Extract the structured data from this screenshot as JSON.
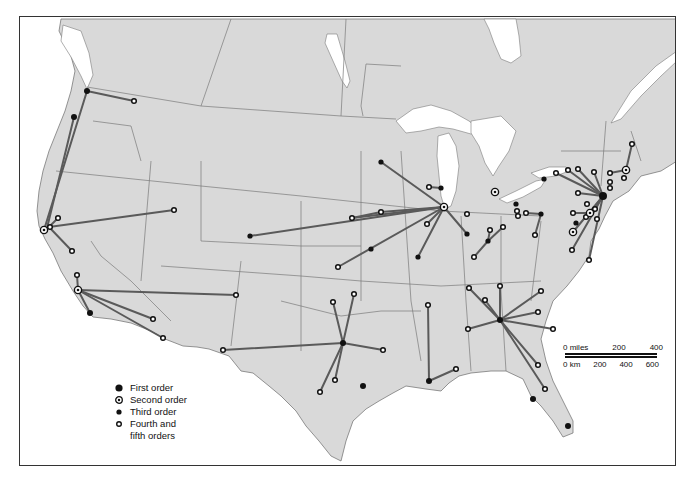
{
  "map": {
    "colors": {
      "land": "#d9d9d9",
      "water": "#ffffff",
      "border": "#7a7a7a",
      "link": "#5a5a5a",
      "frame": "#333333"
    }
  },
  "legend": {
    "items": [
      {
        "symbol": "first-order",
        "label": "First order"
      },
      {
        "symbol": "second-order",
        "label": "Second order"
      },
      {
        "symbol": "third-order",
        "label": "Third order"
      },
      {
        "symbol": "fourth-fifth-order",
        "label": "Fourth and"
      },
      {
        "symbol": "none",
        "label": "fifth orders"
      }
    ]
  },
  "scale_bar": {
    "miles_label": "0 miles",
    "miles_ticks": [
      "200",
      "400"
    ],
    "km_label": "0 km",
    "km_ticks": [
      "200",
      "400",
      "600"
    ]
  },
  "hubs": [
    {
      "name": "Seattle",
      "order": 1,
      "x": 86,
      "y": 90
    },
    {
      "name": "Portland",
      "order": 1,
      "x": 73,
      "y": 116
    },
    {
      "name": "San Francisco",
      "order": 2,
      "x": 43,
      "y": 229
    },
    {
      "name": "Los Angeles",
      "order": 2,
      "x": 77,
      "y": 289
    },
    {
      "name": "San Diego",
      "order": 1,
      "x": 89,
      "y": 312
    },
    {
      "name": "Chicago",
      "order": 2,
      "x": 443,
      "y": 206
    },
    {
      "name": "Dallas",
      "order": 1,
      "x": 342,
      "y": 342
    },
    {
      "name": "Houston",
      "order": 1,
      "x": 362,
      "y": 385
    },
    {
      "name": "New Orleans",
      "order": 1,
      "x": 428,
      "y": 380
    },
    {
      "name": "Atlanta",
      "order": 1,
      "x": 499,
      "y": 319
    },
    {
      "name": "Tampa",
      "order": 1,
      "x": 532,
      "y": 398
    },
    {
      "name": "Miami",
      "order": 1,
      "x": 567,
      "y": 425
    },
    {
      "name": "New York",
      "order": 1,
      "x": 602,
      "y": 195
    },
    {
      "name": "Boston",
      "order": 2,
      "x": 625,
      "y": 169
    },
    {
      "name": "Philadelphia",
      "order": 2,
      "x": 589,
      "y": 212
    },
    {
      "name": "Washington",
      "order": 2,
      "x": 572,
      "y": 231
    },
    {
      "name": "Detroit",
      "order": 2,
      "x": 494,
      "y": 191
    },
    {
      "name": "Minneapolis",
      "order": 1,
      "x": 380,
      "y": 161
    },
    {
      "name": "Kansas City",
      "order": 1,
      "x": 370,
      "y": 248
    },
    {
      "name": "St Louis",
      "order": 1,
      "x": 417,
      "y": 256
    },
    {
      "name": "Cleveland",
      "order": 1,
      "x": 515,
      "y": 203
    },
    {
      "name": "Pittsburgh",
      "order": 1,
      "x": 540,
      "y": 213
    },
    {
      "name": "Buffalo",
      "order": 1,
      "x": 543,
      "y": 178
    },
    {
      "name": "Cincinnati",
      "order": 1,
      "x": 487,
      "y": 240
    },
    {
      "name": "Milwaukee",
      "order": 1,
      "x": 440,
      "y": 187
    },
    {
      "name": "Indianapolis",
      "order": 1,
      "x": 466,
      "y": 233
    },
    {
      "name": "Denver",
      "order": 1,
      "x": 249,
      "y": 235
    },
    {
      "name": "Baltimore",
      "order": 1,
      "x": 575,
      "y": 222
    }
  ]
}
